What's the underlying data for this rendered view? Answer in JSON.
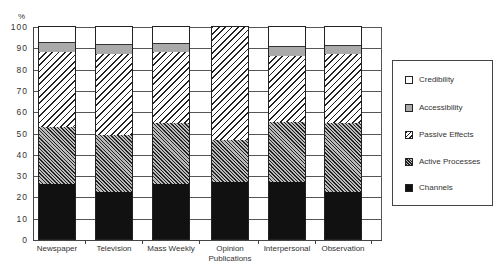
{
  "chart_data": {
    "type": "bar",
    "stacked": true,
    "title": "",
    "xlabel": "",
    "ylabel": "%",
    "ylim": [
      0,
      100
    ],
    "yticks": [
      0,
      10,
      20,
      30,
      40,
      50,
      60,
      70,
      80,
      90,
      100
    ],
    "grid": true,
    "legend_position": "right",
    "categories": [
      "Newspaper",
      "Television",
      "Mass Weekly",
      "Opinion Publications",
      "Interpersonal",
      "Observation"
    ],
    "series": [
      {
        "name": "Channels",
        "values": [
          26,
          22,
          26,
          27,
          27,
          22
        ]
      },
      {
        "name": "Active Processes",
        "values": [
          27,
          27,
          28.5,
          19.5,
          28,
          32.5
        ]
      },
      {
        "name": "Passive Effects",
        "values": [
          35,
          38.5,
          33.5,
          53.5,
          31.5,
          33
        ]
      },
      {
        "name": "Accessibility",
        "values": [
          5,
          4.5,
          4.5,
          0,
          4.5,
          4
        ]
      },
      {
        "name": "Credibility",
        "values": [
          7,
          8,
          7.5,
          0,
          9,
          8.5
        ]
      }
    ]
  },
  "axis": {
    "unit_label": "%",
    "yticks": [
      "0",
      "10",
      "20",
      "30",
      "40",
      "50",
      "60",
      "70",
      "80",
      "90",
      "100"
    ]
  },
  "xlabels": [
    {
      "line1": "Newspaper",
      "line2": ""
    },
    {
      "line1": "Television",
      "line2": ""
    },
    {
      "line1": "Mass Weekly",
      "line2": ""
    },
    {
      "line1": "Opinion",
      "line2": "Publications"
    },
    {
      "line1": "Interpersonal",
      "line2": ""
    },
    {
      "line1": "Observation",
      "line2": ""
    }
  ],
  "legend": [
    {
      "label": "Credibility",
      "swatch": "white"
    },
    {
      "label": "Accessibility",
      "swatch": "light-gray"
    },
    {
      "label": "Passive Effects",
      "swatch": "diagonal-hatch"
    },
    {
      "label": "Active Processes",
      "swatch": "dense-crosshatch"
    },
    {
      "label": "Channels",
      "swatch": "black"
    }
  ]
}
